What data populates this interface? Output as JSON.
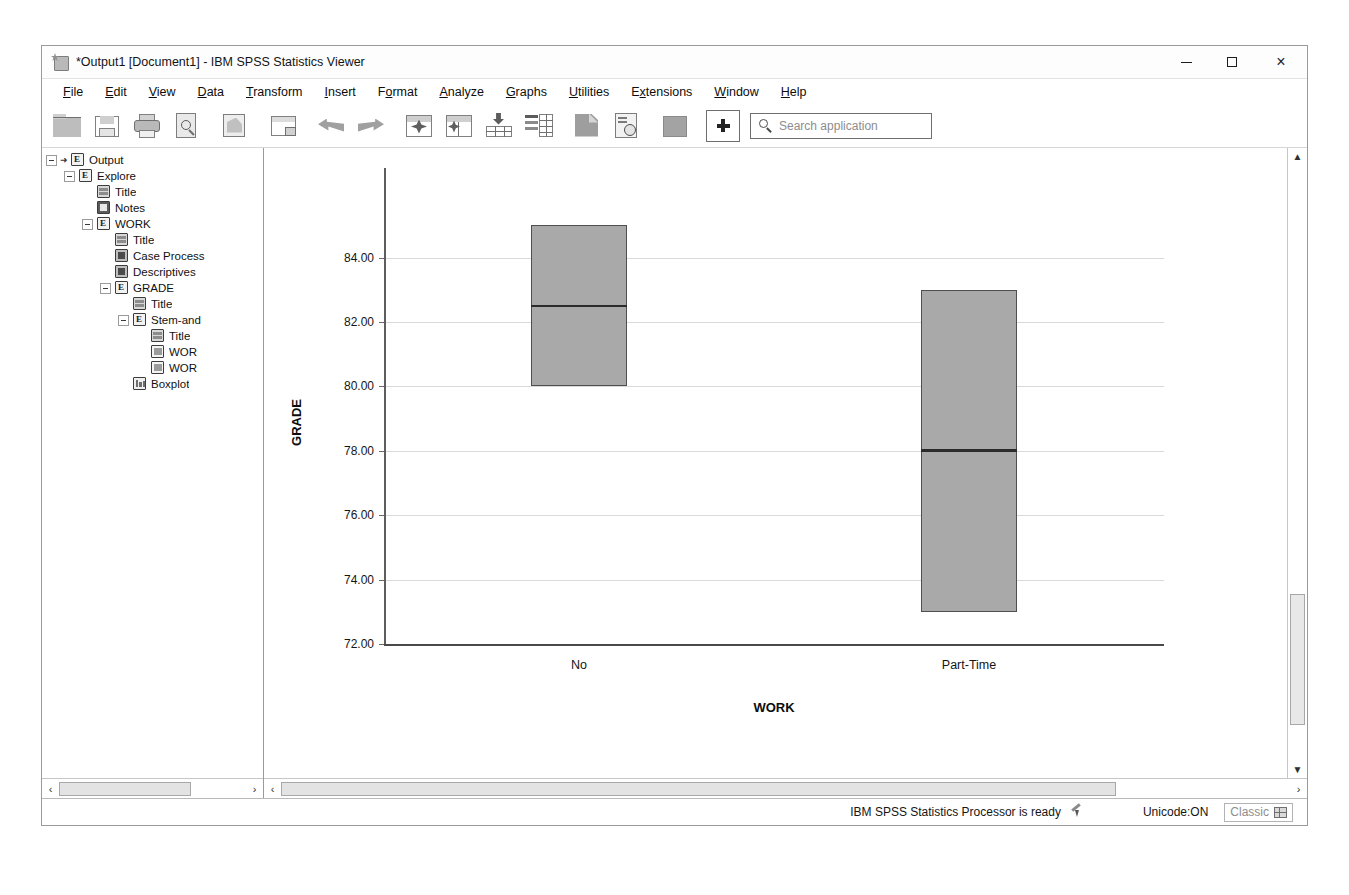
{
  "window": {
    "title": "*Output1 [Document1] - IBM SPSS Statistics Viewer",
    "icon": "spss-viewer-icon",
    "controls": {
      "minimize": "minimize-button",
      "maximize": "maximize-button",
      "close": "×"
    }
  },
  "menubar": [
    {
      "label": "File",
      "accel": "F"
    },
    {
      "label": "Edit",
      "accel": "E"
    },
    {
      "label": "View",
      "accel": "V"
    },
    {
      "label": "Data",
      "accel": "D"
    },
    {
      "label": "Transform",
      "accel": "T"
    },
    {
      "label": "Insert",
      "accel": "I"
    },
    {
      "label": "Format",
      "accel": "o"
    },
    {
      "label": "Analyze",
      "accel": "A"
    },
    {
      "label": "Graphs",
      "accel": "G"
    },
    {
      "label": "Utilities",
      "accel": "U"
    },
    {
      "label": "Extensions",
      "accel": "x"
    },
    {
      "label": "Window",
      "accel": "W"
    },
    {
      "label": "Help",
      "accel": "H"
    }
  ],
  "toolbar": {
    "icons": [
      "open-file-icon",
      "save-icon",
      "print-icon",
      "print-preview-icon",
      "recall-dialogs-icon",
      "export-icon",
      "undo-icon",
      "redo-icon",
      "go-to-case-icon",
      "go-to-variable-icon",
      "insert-cases-icon",
      "insert-variable-icon",
      "split-file-icon",
      "select-cases-icon",
      "value-labels-icon"
    ],
    "add_button": "add-button",
    "search": {
      "placeholder": "Search application",
      "icon": "search-icon"
    }
  },
  "outline": {
    "nodes": [
      {
        "label": "Output",
        "indent": 0,
        "icon": "output-icon",
        "toggle": "minus",
        "arrow": true
      },
      {
        "label": "Explore",
        "indent": 1,
        "icon": "output-icon",
        "toggle": "minus",
        "arrow": false
      },
      {
        "label": "Title",
        "indent": 2,
        "icon": "title-icon",
        "toggle": "none",
        "arrow": false
      },
      {
        "label": "Notes",
        "indent": 2,
        "icon": "notes-icon",
        "toggle": "none",
        "arrow": false
      },
      {
        "label": "WORK",
        "indent": 2,
        "icon": "output-icon",
        "toggle": "minus",
        "arrow": false
      },
      {
        "label": "Title",
        "indent": 3,
        "icon": "title-icon",
        "toggle": "none",
        "arrow": false
      },
      {
        "label": "Case Process",
        "indent": 3,
        "icon": "table-icon",
        "toggle": "none",
        "arrow": false
      },
      {
        "label": "Descriptives",
        "indent": 3,
        "icon": "table-icon",
        "toggle": "none",
        "arrow": false
      },
      {
        "label": "GRADE",
        "indent": 3,
        "icon": "output-icon",
        "toggle": "minus",
        "arrow": false
      },
      {
        "label": "Title",
        "indent": 4,
        "icon": "title-icon",
        "toggle": "none",
        "arrow": false
      },
      {
        "label": "Stem-and",
        "indent": 4,
        "icon": "output-icon",
        "toggle": "minus",
        "arrow": false
      },
      {
        "label": "Title",
        "indent": 5,
        "icon": "title-icon",
        "toggle": "none",
        "arrow": false
      },
      {
        "label": "WOR",
        "indent": 5,
        "icon": "page-icon",
        "toggle": "none",
        "arrow": false
      },
      {
        "label": "WOR",
        "indent": 5,
        "icon": "page-icon",
        "toggle": "none",
        "arrow": false
      },
      {
        "label": "Boxplot",
        "indent": 4,
        "icon": "boxplot-icon",
        "toggle": "none",
        "arrow": false
      }
    ],
    "scrollbar": {
      "left_arrow": "‹",
      "right_arrow": "›"
    }
  },
  "viewer": {
    "scrollbar_h": {
      "left_arrow": "‹",
      "right_arrow": "›"
    },
    "scrollbar_v": {
      "up_arrow": "▲",
      "down_arrow": "▼"
    }
  },
  "chart_data": {
    "type": "box",
    "title": "",
    "xlabel": "WORK",
    "ylabel": "GRADE",
    "categories": [
      "No",
      "Part-Time"
    ],
    "ylim": [
      72.0,
      85.6
    ],
    "yticks": [
      72.0,
      74.0,
      76.0,
      78.0,
      80.0,
      82.0,
      84.0
    ],
    "ytick_labels": [
      "72.00",
      "74.00",
      "76.00",
      "78.00",
      "80.00",
      "82.00",
      "84.00"
    ],
    "grid": true,
    "legend": "none",
    "fill_color": "#a9a9a9",
    "border_color": "#4f4f4f",
    "median_color": "#2b2b2b",
    "boxes": [
      {
        "category": "No",
        "q1": 80.0,
        "median": 82.5,
        "q3": 85.0
      },
      {
        "category": "Part-Time",
        "q1": 73.0,
        "median": 78.0,
        "q3": 83.0
      }
    ]
  },
  "statusbar": {
    "message": "IBM SPSS Statistics Processor is ready",
    "pen_icon": "pen-indicator-icon",
    "unicode": "Unicode:ON",
    "mode": "Classic",
    "mode_icon": "grid-icon"
  }
}
